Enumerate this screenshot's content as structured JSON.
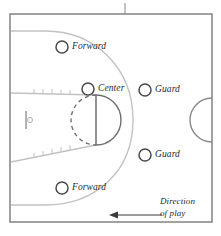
{
  "figure": {
    "background_color": "#ffffff"
  },
  "colors": {
    "frame": "#8a8a8a",
    "court_line_light": "#b9b9b9",
    "court_line_dark": "#6e6e6e",
    "marker_stroke": "#4a4a4a",
    "text": "#2b2b2b",
    "arrow": "#3a3a3a"
  },
  "labels": {
    "forward_top": "Forward",
    "center": "Center",
    "guard_top": "Guard",
    "guard_bottom": "Guard",
    "forward_bottom": "Forward",
    "direction_line1": "Direction",
    "direction_line2": "of play"
  },
  "markers": [
    {
      "name": "forward-top",
      "label": "Forward",
      "cx": 62,
      "cy": 47,
      "r": 6
    },
    {
      "name": "center",
      "label": "Center",
      "cx": 88,
      "cy": 89,
      "r": 6
    },
    {
      "name": "guard-top",
      "label": "Guard",
      "cx": 145,
      "cy": 90,
      "r": 6
    },
    {
      "name": "guard-bottom",
      "label": "Guard",
      "cx": 145,
      "cy": 155,
      "r": 6
    },
    {
      "name": "forward-bottom",
      "label": "Forward",
      "cx": 62,
      "cy": 188,
      "r": 6
    }
  ],
  "court": {
    "frame": {
      "x": 10,
      "y": 14,
      "width": 202,
      "height": 208
    },
    "three_point_arc": "left-side arc from baseline to baseline",
    "free_throw_circle": {
      "cx": 96,
      "cy": 120,
      "r": 25,
      "left_half": "dashed",
      "right_half": "solid"
    },
    "free_throw_line": {
      "x": 96,
      "y1": 95,
      "y2": 145
    },
    "center_circle": {
      "cx": 212,
      "cy": 120,
      "r": 22,
      "visible_half": "left"
    },
    "backboard": {
      "x": 26,
      "y1": 111,
      "y2": 129
    },
    "hoop": {
      "cx": 30,
      "cy": 120,
      "r": 2.5
    },
    "top_tick": {
      "x": 125,
      "y1": 3,
      "y2": 14
    }
  },
  "direction_arrow": {
    "name": "direction-of-play-arrow",
    "from_x": 162,
    "to_x": 110,
    "y": 215,
    "points": "left"
  }
}
